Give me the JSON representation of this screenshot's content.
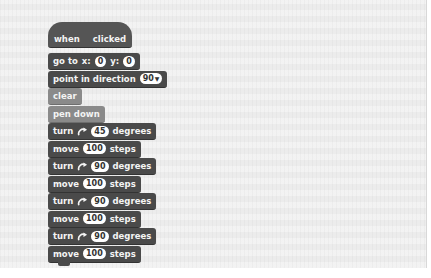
{
  "canvas": {
    "background": "#ececec"
  },
  "script": {
    "hat": {
      "when": "when",
      "clicked": "clicked",
      "icon": "green-flag-icon"
    },
    "goto": {
      "label1": "go to",
      "label_x": "x:",
      "x": "0",
      "label_y": "y:",
      "y": "0"
    },
    "point": {
      "label": "point in direction",
      "value": "90",
      "arrow": "▼"
    },
    "clear": {
      "label": "clear"
    },
    "pen_down": {
      "label": "pen down"
    },
    "steps": [
      {
        "type": "turn",
        "label": "turn",
        "value": "45",
        "unit": "degrees"
      },
      {
        "type": "move",
        "label": "move",
        "value": "100",
        "unit": "steps"
      },
      {
        "type": "turn",
        "label": "turn",
        "value": "90",
        "unit": "degrees"
      },
      {
        "type": "move",
        "label": "move",
        "value": "100",
        "unit": "steps"
      },
      {
        "type": "turn",
        "label": "turn",
        "value": "90",
        "unit": "degrees"
      },
      {
        "type": "move",
        "label": "move",
        "value": "100",
        "unit": "steps"
      },
      {
        "type": "turn",
        "label": "turn",
        "value": "90",
        "unit": "degrees"
      },
      {
        "type": "move",
        "label": "move",
        "value": "100",
        "unit": "steps"
      }
    ]
  },
  "colors": {
    "motion_block": "#4a4a4a",
    "pen_block": "#8a8a8a",
    "hat_block": "#555555"
  }
}
